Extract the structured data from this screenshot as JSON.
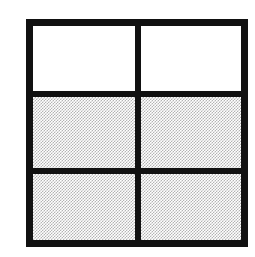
{
  "figure": {
    "background_color": "#ffffff",
    "rule_color": "#111111",
    "fill_color": "#d0d0d0",
    "empty_color": "#ffffff",
    "geometry": {
      "canvas_width": 255,
      "canvas_height": 257,
      "grid_left": 26,
      "grid_top": 19,
      "grid_width": 222,
      "grid_height": 228,
      "outer_rule_thickness": 7,
      "inner_rule_thickness": 6,
      "columns": 2,
      "rows": 3
    },
    "column_ratios": [
      1.02,
      1
    ],
    "row_ratios": [
      1,
      1.08,
      1.02
    ],
    "cells": [
      {
        "id": "cell-r1-c1",
        "row": 1,
        "column": 1,
        "fill": "none",
        "label": ""
      },
      {
        "id": "cell-r1-c2",
        "row": 1,
        "column": 2,
        "fill": "none",
        "label": ""
      },
      {
        "id": "cell-r2-c1",
        "row": 2,
        "column": 1,
        "fill": "hatch",
        "label": ""
      },
      {
        "id": "cell-r2-c2",
        "row": 2,
        "column": 2,
        "fill": "hatch",
        "label": ""
      },
      {
        "id": "cell-r3-c1",
        "row": 3,
        "column": 1,
        "fill": "hatch",
        "label": ""
      },
      {
        "id": "cell-r3-c2",
        "row": 3,
        "column": 2,
        "fill": "hatch",
        "label": ""
      }
    ]
  }
}
